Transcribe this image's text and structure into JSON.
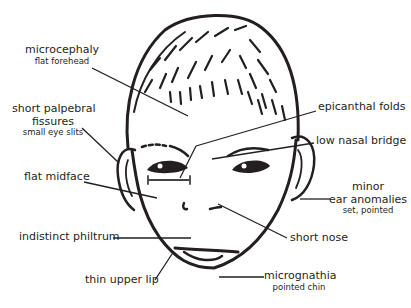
{
  "diagram": {
    "colors": {
      "ink": "#231f20",
      "background": "#ffffff"
    },
    "labels": [
      {
        "id": "microcephaly",
        "main": "microcephaly",
        "sub": "flat forehead"
      },
      {
        "id": "palpebral",
        "main": "short palpebral",
        "main2": "fissures",
        "sub": "small eye slits"
      },
      {
        "id": "midface",
        "main": "flat midface"
      },
      {
        "id": "philtrum",
        "main": "indistinct philtrum"
      },
      {
        "id": "lip",
        "main": "thin upper lip"
      },
      {
        "id": "epicanthal",
        "main": "epicanthal folds"
      },
      {
        "id": "nasal",
        "main": "low nasal bridge"
      },
      {
        "id": "ear",
        "main": "minor",
        "main2": "ear anomalies",
        "sub": "set, pointed"
      },
      {
        "id": "nose",
        "main": "short nose"
      },
      {
        "id": "micrognathia",
        "main": "micrognathia",
        "sub": "pointed chin"
      }
    ]
  }
}
